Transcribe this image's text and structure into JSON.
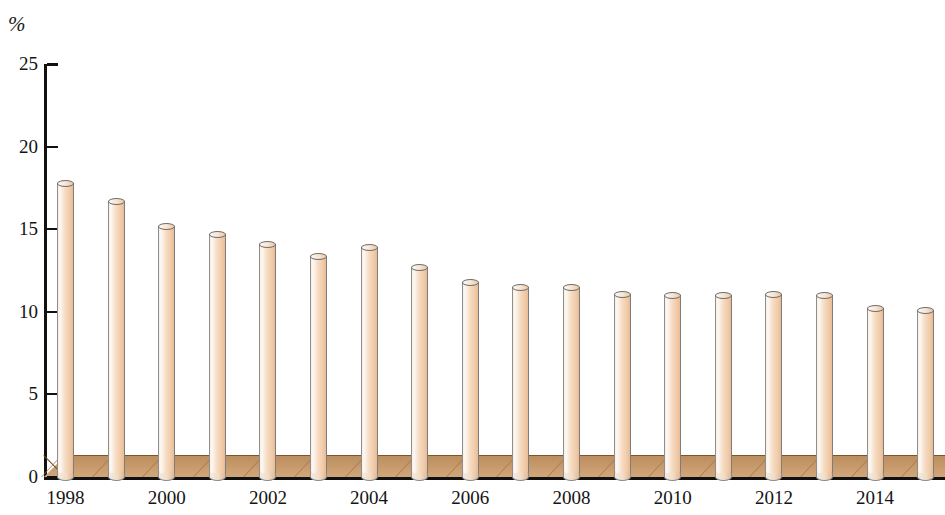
{
  "chart_data": {
    "type": "bar",
    "title": "",
    "subtitle": "",
    "unit_label": "%",
    "xlabel": "",
    "ylabel": "%",
    "ylim": [
      0,
      25
    ],
    "y_ticks": [
      0,
      5,
      10,
      15,
      20,
      25
    ],
    "y_tick_labels": [
      "0",
      "5",
      "10",
      "15",
      "20",
      "25"
    ],
    "grid": false,
    "legend": null,
    "categories": [
      "1998",
      "1999",
      "2000",
      "2001",
      "2002",
      "2003",
      "2004",
      "2005",
      "2006",
      "2007",
      "2008",
      "2009",
      "2010",
      "2011",
      "2012",
      "2013",
      "2014",
      "2015"
    ],
    "x_tick_labels_shown": [
      "1998",
      "2000",
      "2002",
      "2004",
      "2006",
      "2008",
      "2010",
      "2012",
      "2014"
    ],
    "values": [
      17.8,
      16.7,
      15.2,
      14.7,
      14.1,
      13.4,
      13.9,
      12.7,
      11.8,
      11.5,
      11.5,
      11.1,
      11.0,
      11.0,
      11.1,
      11.0,
      10.2,
      10.1
    ],
    "bar_style": "3d-cylinder",
    "colors": {
      "bar_fill_light": "#fdf8f2",
      "bar_fill_mid": "#f6dcc4",
      "bar_fill_dark": "#e7bb95",
      "bar_outline": "#7d7d7d",
      "floor": "#c99d6f",
      "floor_edge": "#6d4b22",
      "axis": "#111111",
      "text": "#141414",
      "background": "#ffffff"
    }
  }
}
